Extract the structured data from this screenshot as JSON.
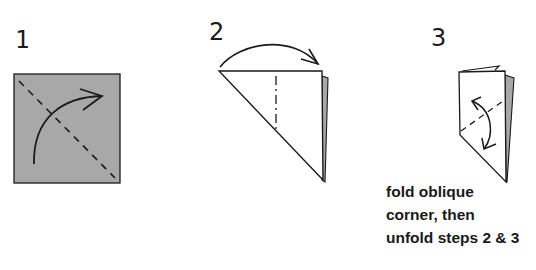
{
  "diagram": {
    "type": "origami-instructions",
    "colors": {
      "paper_back": "#a8a8a8",
      "paper_front": "#ffffff",
      "stroke": "#1a1a1a"
    },
    "steps": [
      {
        "number": "1",
        "shape": "square",
        "fold_line": "valley (dashed) diagonal top-left to bottom-right",
        "arrow": "curved arrow from lower-left sweeping to upper-right"
      },
      {
        "number": "2",
        "shape": "right triangle",
        "fold_line": "mountain (dash-dot) vertical",
        "arrow": "arched arrow from left corner over to right edge"
      },
      {
        "number": "3",
        "shape": "folded quadrilateral",
        "fold_line": "valley (dashed) oblique",
        "arrow": "double-headed curved arrow (fold and unfold)"
      }
    ],
    "caption": {
      "lines": [
        "fold oblique",
        "corner, then",
        "unfold steps 2 & 3"
      ]
    }
  }
}
